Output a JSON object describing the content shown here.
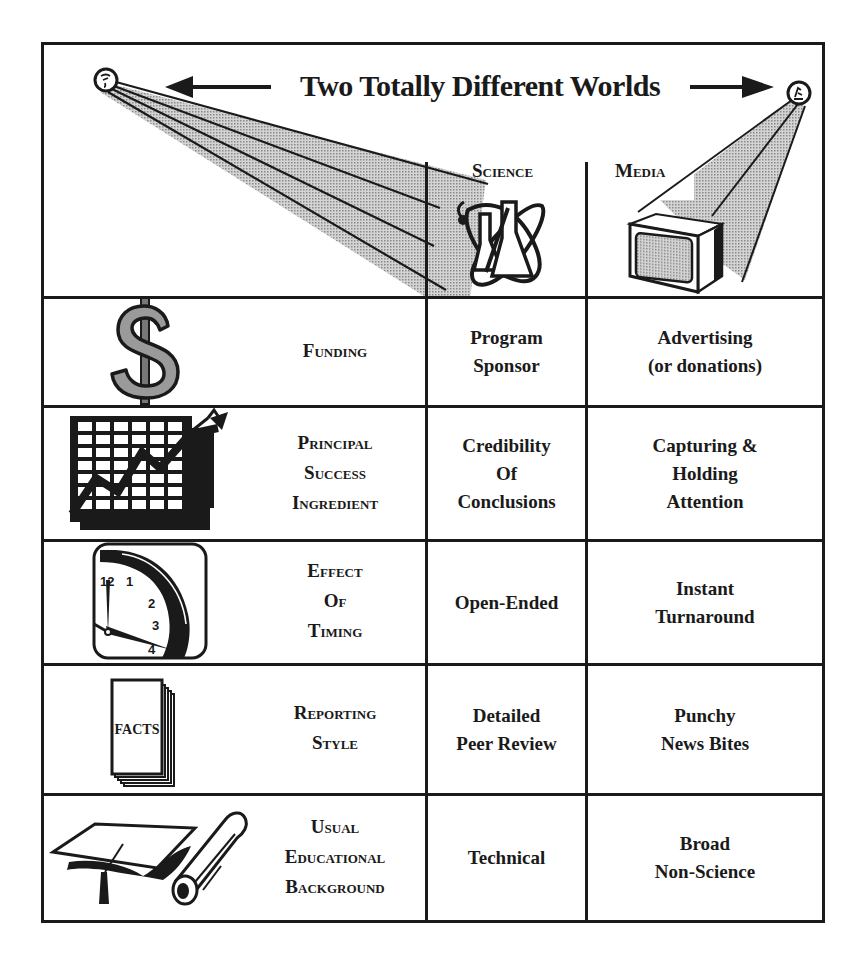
{
  "title": "Two Totally Different Worlds",
  "columns": {
    "science": "Science",
    "media": "Media"
  },
  "rows": [
    {
      "icon": "dollar-sign-icon",
      "category": [
        "Funding"
      ],
      "science": [
        "Program",
        "Sponsor"
      ],
      "media": [
        "Advertising",
        "(or donations)"
      ]
    },
    {
      "icon": "rising-chart-icon",
      "category": [
        "Principal",
        "Success",
        "Ingredient"
      ],
      "science": [
        "Credibility",
        "Of",
        "Conclusions"
      ],
      "media": [
        "Capturing &",
        "Holding",
        "Attention"
      ]
    },
    {
      "icon": "clock-icon",
      "category": [
        "Effect",
        "Of",
        "Timing"
      ],
      "science": [
        "Open-Ended"
      ],
      "media": [
        "Instant",
        "Turnaround"
      ]
    },
    {
      "icon": "facts-stack-icon",
      "category": [
        "Reporting",
        "Style"
      ],
      "science": [
        "Detailed",
        "Peer Review"
      ],
      "media": [
        "Punchy",
        "News Bites"
      ]
    },
    {
      "icon": "graduation-cap-diploma-icon",
      "category": [
        "Usual",
        "Educational",
        "Background"
      ],
      "science": [
        "Technical"
      ],
      "media": [
        "Broad",
        "Non-Science"
      ]
    }
  ],
  "icons": {
    "facts_label": "FACTS",
    "clock_numbers": [
      "12",
      "1",
      "2",
      "3",
      "4"
    ]
  }
}
